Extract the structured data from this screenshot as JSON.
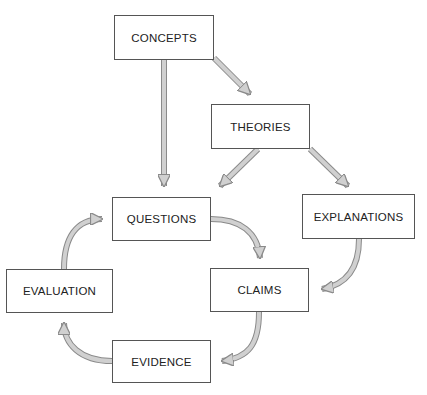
{
  "diagram": {
    "nodes": [
      {
        "id": "concepts",
        "label": "CONCEPTS"
      },
      {
        "id": "theories",
        "label": "THEORIES"
      },
      {
        "id": "questions",
        "label": "QUESTIONS"
      },
      {
        "id": "explanations",
        "label": "EXPLANATIONS"
      },
      {
        "id": "claims",
        "label": "CLAIMS"
      },
      {
        "id": "evaluation",
        "label": "EVALUATION"
      },
      {
        "id": "evidence",
        "label": "EVIDENCE"
      }
    ],
    "edges": [
      {
        "from": "concepts",
        "to": "questions"
      },
      {
        "from": "concepts",
        "to": "theories"
      },
      {
        "from": "theories",
        "to": "questions"
      },
      {
        "from": "theories",
        "to": "explanations"
      },
      {
        "from": "explanations",
        "to": "claims"
      },
      {
        "from": "questions",
        "to": "claims"
      },
      {
        "from": "claims",
        "to": "evidence"
      },
      {
        "from": "evidence",
        "to": "evaluation"
      },
      {
        "from": "evaluation",
        "to": "questions"
      }
    ],
    "colors": {
      "arrow_fill": "#d0d0d0",
      "arrow_stroke": "#8a8a8a",
      "box_border": "#555555"
    }
  }
}
